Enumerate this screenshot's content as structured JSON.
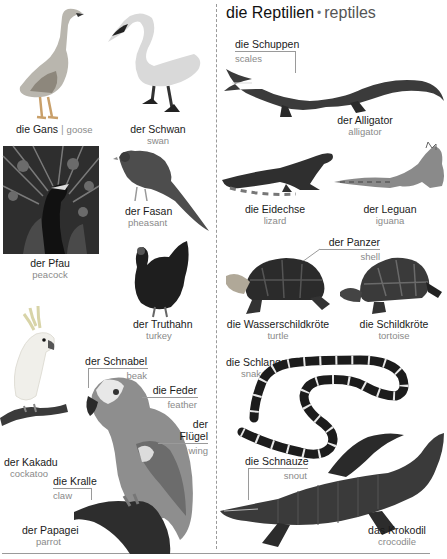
{
  "page": {
    "section_title": {
      "german": "die Reptilien",
      "bullet": "•",
      "english": "reptiles"
    }
  },
  "birds": {
    "goose": {
      "german": "die Gans",
      "separator": "|",
      "english": "goose"
    },
    "swan": {
      "german": "der Schwan",
      "english": "swan"
    },
    "peacock": {
      "german": "der Pfau",
      "english": "peacock"
    },
    "pheasant": {
      "german": "der Fasan",
      "english": "pheasant"
    },
    "turkey": {
      "german": "der Truthahn",
      "english": "turkey"
    },
    "cockatoo": {
      "german": "der Kakadu",
      "english": "cockatoo"
    },
    "parrot": {
      "german": "der Papagei",
      "english": "parrot",
      "parts": {
        "beak": {
          "german": "der Schnabel",
          "english": "beak"
        },
        "feather": {
          "german": "die Feder",
          "english": "feather"
        },
        "wing": {
          "german_line1": "der",
          "german_line2": "Flügel",
          "english": "wing"
        },
        "claw": {
          "german": "die Kralle",
          "english": "claw"
        }
      }
    }
  },
  "reptiles": {
    "alligator": {
      "german": "der Alligator",
      "english": "alligator",
      "parts": {
        "scales": {
          "german": "die Schuppen",
          "english": "scales"
        }
      }
    },
    "lizard": {
      "german": "die Eidechse",
      "english": "lizard"
    },
    "iguana": {
      "german": "der Leguan",
      "english": "iguana"
    },
    "turtle": {
      "german": "die Wasserschildkröte",
      "english": "turtle",
      "parts": {
        "shell": {
          "german": "der Panzer",
          "english": "shell"
        }
      }
    },
    "tortoise": {
      "german": "die Schildkröte",
      "english": "tortoise"
    },
    "snake": {
      "german": "die Schlange",
      "english": "snake"
    },
    "crocodile": {
      "german": "das Krokodil",
      "english": "crocodile",
      "parts": {
        "snout": {
          "german": "die Schnauze",
          "english": "snout"
        }
      }
    }
  },
  "colors": {
    "text_primary": "#1a1a1a",
    "text_secondary": "#8a8a8a",
    "divider": "#9a9a9a"
  }
}
